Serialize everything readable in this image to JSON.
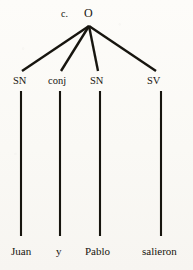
{
  "figure": {
    "kind": "syntax-tree",
    "item_marker": "c.",
    "sentence": "Juan y Pablo salieron",
    "ink_color": "#17150f",
    "paper_color": "#fbfaf7"
  },
  "root": {
    "label": "O"
  },
  "nodes": [
    {
      "label": "SN",
      "leaf": "Juan"
    },
    {
      "label": "conj",
      "leaf": "y"
    },
    {
      "label": "SN",
      "leaf": "Pablo"
    },
    {
      "label": "SV",
      "leaf": "salieron"
    }
  ]
}
